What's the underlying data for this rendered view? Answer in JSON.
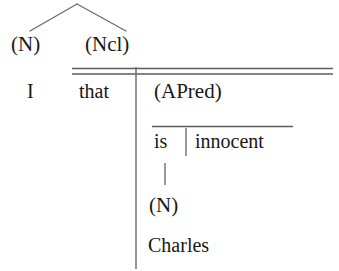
{
  "diagram": {
    "type": "syntactic-tree",
    "title": "",
    "colors": {
      "ink": "#181818",
      "rule": "#6f6f6f",
      "background": "#ffffff"
    },
    "nodes": {
      "top_left_category": "(N)",
      "top_right_category": "(Ncl)",
      "subject_word": "I",
      "complementizer_word": "that",
      "apred_category": "(APred)",
      "copula_word": "is",
      "predicate_word": "innocent",
      "lower_noun_category": "(N)",
      "lower_noun_word": "Charles"
    },
    "edges": [
      {
        "name": "apex-to-left",
        "from": "apex",
        "to": "(N)"
      },
      {
        "name": "apex-to-right",
        "from": "apex",
        "to": "(Ncl)"
      },
      {
        "name": "ncl-spine",
        "from": "(Ncl)",
        "to": "Charles"
      },
      {
        "name": "apred-stem",
        "from": "innocent-row",
        "to": "(N)"
      }
    ],
    "rules": [
      {
        "name": "double-rule-top",
        "style": "double"
      },
      {
        "name": "apred-underline",
        "style": "single"
      },
      {
        "name": "is-innocent-divider",
        "style": "vertical"
      },
      {
        "name": "that-divider",
        "style": "vertical"
      }
    ]
  }
}
